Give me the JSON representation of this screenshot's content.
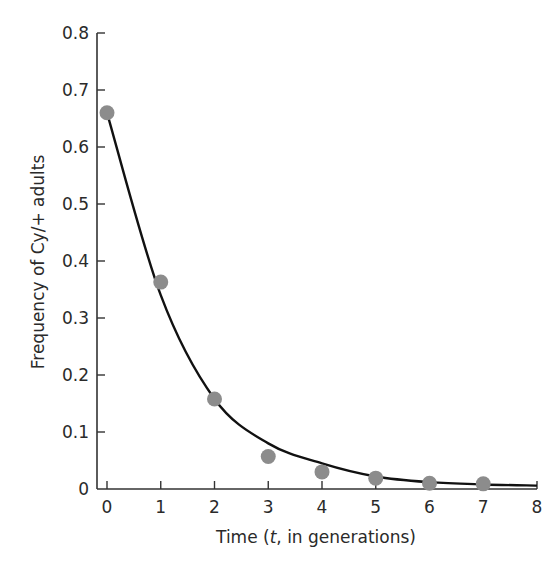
{
  "chart_data": {
    "type": "scatter",
    "title": "",
    "xlabel": "Time (t, in generations)",
    "ylabel": "Frequency of Cy/+ adults",
    "xlim": [
      0,
      8
    ],
    "ylim": [
      0,
      0.8
    ],
    "grid": false,
    "legend": null,
    "x_ticks": [
      "0",
      "1",
      "2",
      "3",
      "4",
      "5",
      "6",
      "7",
      "8"
    ],
    "y_ticks": [
      "0",
      "0.1",
      "0.2",
      "0.3",
      "0.4",
      "0.5",
      "0.6",
      "0.7",
      "0.8"
    ],
    "series": [
      {
        "name": "Observed frequency",
        "type": "scatter",
        "color": "#8c8c8c",
        "x": [
          0,
          1,
          2,
          3,
          4,
          5,
          6,
          7
        ],
        "values": [
          0.66,
          0.363,
          0.158,
          0.057,
          0.03,
          0.019,
          0.01,
          0.009
        ]
      },
      {
        "name": "Fitted curve",
        "type": "line",
        "color": "#111111",
        "x": [
          0,
          1,
          2,
          3,
          4,
          5,
          6,
          7,
          8
        ],
        "values": [
          0.66,
          0.34,
          0.158,
          0.08,
          0.045,
          0.022,
          0.012,
          0.008,
          0.006
        ]
      }
    ]
  },
  "labels": {
    "xlabel_prefix": "Time (",
    "xlabel_var": "t",
    "xlabel_suffix": ", in generations)",
    "ylabel": "Frequency of Cy/+ adults"
  }
}
